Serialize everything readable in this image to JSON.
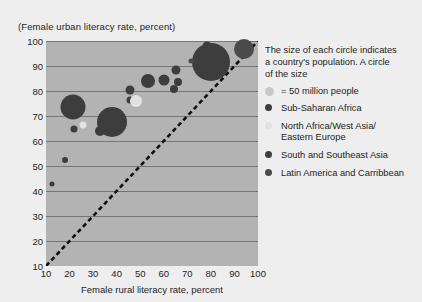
{
  "chart_data": {
    "type": "scatter",
    "title": "(Female urban literacy rate, percent)",
    "xlabel": "Female rural literacy rate, percent",
    "ylabel": "(Female urban literacy rate, percent)",
    "xlim": [
      10,
      100
    ],
    "ylim": [
      10,
      100
    ],
    "xticks": [
      10,
      20,
      30,
      40,
      50,
      60,
      70,
      80,
      90,
      100
    ],
    "yticks": [
      10,
      20,
      30,
      40,
      50,
      60,
      70,
      80,
      90,
      100
    ],
    "grid": true,
    "legend_position": "right",
    "reference_line": {
      "type": "identity-diagonal",
      "style": "dashed",
      "from": [
        10,
        10
      ],
      "to": [
        100,
        100
      ]
    },
    "size_encoding": {
      "note": "The size of each circle indicates a country's population. A circle of the size",
      "reference_label": "= 50 million people",
      "reference_value": 50
    },
    "series": [
      {
        "name": "Sub-Saharan Africa",
        "color": "#3d3d3d",
        "points": [
          {
            "x": 12.5,
            "y": 43,
            "size": 5
          },
          {
            "x": 18,
            "y": 52.5,
            "size": 6
          },
          {
            "x": 21.5,
            "y": 73.5,
            "size": 25
          },
          {
            "x": 22,
            "y": 65,
            "size": 7
          },
          {
            "x": 33,
            "y": 64,
            "size": 10
          },
          {
            "x": 45.5,
            "y": 76.5,
            "size": 7
          },
          {
            "x": 45.5,
            "y": 80.5,
            "size": 9
          },
          {
            "x": 53.5,
            "y": 84,
            "size": 14
          },
          {
            "x": 60,
            "y": 84.5,
            "size": 11
          },
          {
            "x": 64.5,
            "y": 81,
            "size": 8
          },
          {
            "x": 65,
            "y": 88.5,
            "size": 9
          },
          {
            "x": 66,
            "y": 83.5,
            "size": 8
          },
          {
            "x": 76.5,
            "y": 89,
            "size": 17
          }
        ]
      },
      {
        "name": "North Africa/West Asia/ Eastern Europe",
        "color": "#e2e2e2",
        "points": [
          {
            "x": 25.5,
            "y": 66.5,
            "size": 7
          },
          {
            "x": 48,
            "y": 76,
            "size": 12
          }
        ]
      },
      {
        "name": "South and Southeast Asia",
        "color": "#3d3d3d",
        "points": [
          {
            "x": 38,
            "y": 67.5,
            "size": 30
          },
          {
            "x": 40.5,
            "y": 71,
            "size": 10
          },
          {
            "x": 80,
            "y": 91.5,
            "size": 38
          },
          {
            "x": 84,
            "y": 93,
            "size": 18
          },
          {
            "x": 78.5,
            "y": 98,
            "size": 9
          }
        ]
      },
      {
        "name": "Latin America and Carribbean",
        "color": "#4a4a4a",
        "points": [
          {
            "x": 71.5,
            "y": 92,
            "size": 5
          },
          {
            "x": 94,
            "y": 97,
            "size": 20
          }
        ]
      }
    ]
  },
  "legend": {
    "note_line1": "The size of each circle indicates",
    "note_line2": "a country's population. A circle",
    "note_line3": "of the size",
    "size_label": "= 50 million people",
    "items": [
      {
        "label": "Sub-Saharan Africa",
        "color": "#3d3d3d",
        "swatch": 7
      },
      {
        "label": "North Africa/West Asia/\nEastern Europe",
        "color": "#e2e2e2",
        "swatch": 7
      },
      {
        "label": "South and Southeast Asia",
        "color": "#3d3d3d",
        "swatch": 7
      },
      {
        "label": "Latin America and Carribbean",
        "color": "#4a4a4a",
        "swatch": 7
      }
    ]
  },
  "colors": {
    "plot_background": "#b3b3b3",
    "figure_background": "#eeeeee",
    "gridline": "#757575",
    "text": "#1d1d1d",
    "diagonal": "#111111"
  }
}
